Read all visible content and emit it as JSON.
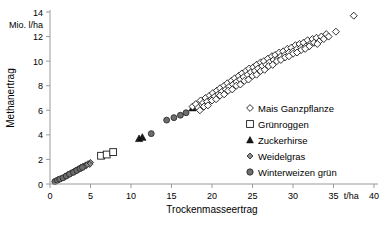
{
  "chart_data": {
    "type": "scatter",
    "title": "",
    "xlabel": "Trockenmasseertrag",
    "ylabel": "Methanertrag",
    "x_unit": "t/ha",
    "y_unit": "Mio. l/ha",
    "xlim": [
      0,
      40
    ],
    "ylim": [
      0,
      14
    ],
    "xticks": [
      0,
      5,
      10,
      15,
      20,
      25,
      30,
      35,
      40
    ],
    "yticks": [
      0,
      2,
      4,
      6,
      8,
      10,
      12,
      14
    ],
    "grid": false,
    "legend_position": "right-middle",
    "series": [
      {
        "name": "Mais Ganzpflanze",
        "marker": "open-diamond",
        "color": "#ffffff",
        "edge_color": "#1a1a1a",
        "points": [
          [
            17.6,
            6.3
          ],
          [
            18.0,
            6.5
          ],
          [
            18.3,
            6.2
          ],
          [
            18.6,
            6.8
          ],
          [
            18.9,
            6.6
          ],
          [
            19.2,
            7.0
          ],
          [
            19.4,
            6.7
          ],
          [
            19.7,
            7.2
          ],
          [
            19.9,
            6.9
          ],
          [
            20.1,
            7.4
          ],
          [
            20.3,
            7.1
          ],
          [
            20.6,
            7.6
          ],
          [
            20.8,
            7.3
          ],
          [
            21.0,
            7.8
          ],
          [
            21.2,
            7.5
          ],
          [
            21.5,
            8.0
          ],
          [
            21.7,
            7.7
          ],
          [
            21.9,
            8.2
          ],
          [
            22.1,
            7.9
          ],
          [
            22.4,
            8.4
          ],
          [
            22.6,
            8.1
          ],
          [
            22.8,
            8.6
          ],
          [
            23.0,
            8.3
          ],
          [
            23.3,
            8.8
          ],
          [
            23.5,
            8.5
          ],
          [
            23.7,
            9.0
          ],
          [
            23.9,
            8.7
          ],
          [
            24.2,
            9.2
          ],
          [
            24.4,
            8.9
          ],
          [
            24.6,
            9.4
          ],
          [
            24.8,
            9.1
          ],
          [
            25.1,
            9.5
          ],
          [
            25.3,
            9.2
          ],
          [
            25.5,
            9.7
          ],
          [
            25.7,
            9.4
          ],
          [
            26.0,
            9.9
          ],
          [
            26.2,
            9.6
          ],
          [
            26.4,
            10.0
          ],
          [
            26.7,
            9.7
          ],
          [
            26.9,
            10.2
          ],
          [
            27.1,
            9.9
          ],
          [
            27.4,
            10.4
          ],
          [
            27.6,
            10.1
          ],
          [
            27.8,
            10.5
          ],
          [
            28.1,
            10.2
          ],
          [
            28.3,
            10.7
          ],
          [
            28.5,
            10.4
          ],
          [
            28.8,
            10.8
          ],
          [
            29.0,
            10.5
          ],
          [
            29.3,
            11.0
          ],
          [
            29.5,
            10.7
          ],
          [
            29.8,
            11.1
          ],
          [
            30.0,
            10.8
          ],
          [
            30.3,
            11.3
          ],
          [
            30.5,
            11.0
          ],
          [
            30.8,
            11.4
          ],
          [
            31.0,
            11.1
          ],
          [
            31.3,
            11.5
          ],
          [
            31.6,
            11.2
          ],
          [
            31.8,
            11.7
          ],
          [
            32.1,
            11.4
          ],
          [
            32.4,
            11.8
          ],
          [
            32.6,
            11.5
          ],
          [
            32.9,
            11.9
          ],
          [
            33.2,
            11.6
          ],
          [
            33.5,
            12.0
          ],
          [
            33.8,
            11.8
          ],
          [
            34.1,
            12.2
          ],
          [
            34.4,
            12.0
          ],
          [
            35.3,
            12.4
          ],
          [
            37.5,
            13.7
          ],
          [
            19.0,
            6.3
          ],
          [
            20.0,
            6.8
          ],
          [
            21.0,
            7.2
          ],
          [
            22.0,
            7.6
          ],
          [
            23.0,
            8.0
          ],
          [
            24.0,
            8.4
          ],
          [
            25.0,
            8.8
          ],
          [
            26.0,
            9.2
          ],
          [
            27.0,
            9.6
          ],
          [
            28.0,
            10.0
          ],
          [
            29.0,
            10.3
          ],
          [
            30.0,
            10.6
          ],
          [
            31.0,
            10.9
          ],
          [
            32.0,
            11.2
          ],
          [
            18.5,
            6.0
          ],
          [
            19.5,
            6.4
          ],
          [
            20.5,
            6.9
          ],
          [
            21.5,
            7.3
          ],
          [
            22.5,
            7.7
          ],
          [
            23.5,
            8.1
          ],
          [
            24.5,
            8.5
          ],
          [
            25.5,
            8.9
          ],
          [
            26.5,
            9.3
          ],
          [
            27.5,
            9.7
          ],
          [
            28.5,
            10.1
          ],
          [
            29.5,
            10.4
          ],
          [
            30.5,
            10.7
          ],
          [
            31.5,
            11.0
          ],
          [
            33.0,
            11.4
          ]
        ]
      },
      {
        "name": "Grünroggen",
        "marker": "open-square",
        "color": "#ffffff",
        "edge_color": "#1a1a1a",
        "points": [
          [
            6.3,
            2.3
          ],
          [
            7.0,
            2.4
          ],
          [
            7.8,
            2.6
          ]
        ]
      },
      {
        "name": "Zuckerhirse",
        "marker": "filled-triangle",
        "color": "#1a1a1a",
        "edge_color": "#000000",
        "points": [
          [
            11.0,
            3.7
          ],
          [
            11.4,
            3.8
          ],
          [
            17.6,
            6.2
          ],
          [
            17.9,
            6.4
          ]
        ]
      },
      {
        "name": "Weidelgras",
        "marker": "grey-diamond",
        "color": "#8c8c8c",
        "edge_color": "#3a3a3a",
        "points": [
          [
            1.0,
            0.35
          ],
          [
            1.4,
            0.45
          ],
          [
            1.8,
            0.6
          ],
          [
            2.2,
            0.75
          ],
          [
            2.6,
            0.9
          ],
          [
            3.0,
            1.05
          ],
          [
            3.4,
            1.2
          ],
          [
            3.8,
            1.35
          ],
          [
            4.1,
            1.45
          ],
          [
            4.4,
            1.55
          ],
          [
            4.7,
            1.65
          ],
          [
            5.0,
            1.75
          ],
          [
            4.9,
            1.6
          ],
          [
            4.5,
            1.5
          ],
          [
            4.2,
            1.4
          ],
          [
            3.6,
            1.25
          ],
          [
            3.2,
            1.1
          ],
          [
            2.8,
            0.95
          ],
          [
            2.4,
            0.8
          ],
          [
            2.0,
            0.65
          ]
        ]
      },
      {
        "name": "Winterweizen grün",
        "marker": "filled-grey-circle",
        "color": "#6e6e6e",
        "edge_color": "#2a2a2a",
        "points": [
          [
            0.6,
            0.2
          ],
          [
            0.9,
            0.3
          ],
          [
            1.2,
            0.4
          ],
          [
            1.6,
            0.5
          ],
          [
            2.0,
            0.65
          ],
          [
            2.4,
            0.8
          ],
          [
            2.9,
            0.95
          ],
          [
            3.3,
            1.1
          ],
          [
            3.7,
            1.25
          ],
          [
            4.0,
            1.35
          ],
          [
            12.5,
            4.1
          ],
          [
            14.4,
            5.2
          ],
          [
            15.3,
            5.4
          ],
          [
            16.1,
            5.6
          ],
          [
            16.8,
            5.8
          ]
        ]
      }
    ]
  },
  "axes": {
    "y_unit_label": "Mio. l/ha",
    "y_title": "Methanertrag",
    "x_title": "Trockenmasseertrag",
    "x_unit_label": "t/ha",
    "x_tick_labels": [
      "0",
      "5",
      "10",
      "15",
      "20",
      "25",
      "30",
      "35",
      "40"
    ],
    "y_tick_labels": [
      "0",
      "2",
      "4",
      "6",
      "8",
      "10",
      "12",
      "14"
    ]
  },
  "legend": {
    "items": [
      {
        "label": "Mais Ganzpflanze",
        "marker": "open-diamond"
      },
      {
        "label": "Grünroggen",
        "marker": "open-square"
      },
      {
        "label": "Zuckerhirse",
        "marker": "filled-triangle"
      },
      {
        "label": "Weidelgras",
        "marker": "grey-diamond"
      },
      {
        "label": "Winterweizen grün",
        "marker": "filled-grey-circle"
      }
    ]
  },
  "colors": {
    "axis": "#9a9a9a",
    "text": "#000000",
    "marker_dark": "#1a1a1a",
    "marker_grey": "#6e6e6e",
    "marker_grey_light": "#8c8c8c"
  }
}
